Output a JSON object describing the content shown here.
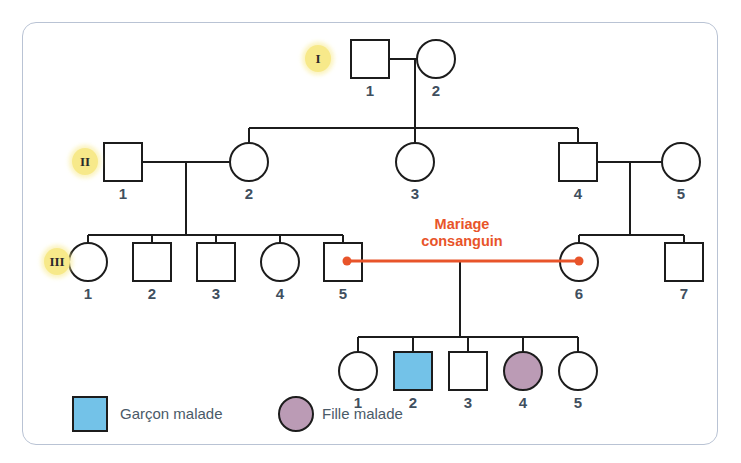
{
  "figure": {
    "accent_orange": "#e8542a",
    "affected_boy_color": "#73c2e8",
    "affected_girl_color": "#bb9bb5",
    "frame_color": "#b9c3d4",
    "number_color": "#3f4f5e",
    "badge_color": "#f7e98a"
  },
  "generations": [
    {
      "label": "I",
      "badge": "I"
    },
    {
      "label": "II",
      "badge": "II"
    },
    {
      "label": "III",
      "badge": "III"
    },
    {
      "label": "IV",
      "badge": ""
    }
  ],
  "individuals": [
    {
      "gen": "I",
      "id": "I-1",
      "number": "1",
      "sex": "male",
      "affected": false
    },
    {
      "gen": "I",
      "id": "I-2",
      "number": "2",
      "sex": "female",
      "affected": false
    },
    {
      "gen": "II",
      "id": "II-1",
      "number": "1",
      "sex": "male",
      "affected": false
    },
    {
      "gen": "II",
      "id": "II-2",
      "number": "2",
      "sex": "female",
      "affected": false
    },
    {
      "gen": "II",
      "id": "II-3",
      "number": "3",
      "sex": "female",
      "affected": false
    },
    {
      "gen": "II",
      "id": "II-4",
      "number": "4",
      "sex": "male",
      "affected": false
    },
    {
      "gen": "II",
      "id": "II-5",
      "number": "5",
      "sex": "female",
      "affected": false
    },
    {
      "gen": "III",
      "id": "III-1",
      "number": "1",
      "sex": "female",
      "affected": false
    },
    {
      "gen": "III",
      "id": "III-2",
      "number": "2",
      "sex": "male",
      "affected": false
    },
    {
      "gen": "III",
      "id": "III-3",
      "number": "3",
      "sex": "male",
      "affected": false
    },
    {
      "gen": "III",
      "id": "III-4",
      "number": "4",
      "sex": "female",
      "affected": false
    },
    {
      "gen": "III",
      "id": "III-5",
      "number": "5",
      "sex": "male",
      "affected": false
    },
    {
      "gen": "III",
      "id": "III-6",
      "number": "6",
      "sex": "female",
      "affected": false
    },
    {
      "gen": "III",
      "id": "III-7",
      "number": "7",
      "sex": "male",
      "affected": false
    },
    {
      "gen": "IV",
      "id": "IV-1",
      "number": "1",
      "sex": "female",
      "affected": false
    },
    {
      "gen": "IV",
      "id": "IV-2",
      "number": "2",
      "sex": "male",
      "affected": true
    },
    {
      "gen": "IV",
      "id": "IV-3",
      "number": "3",
      "sex": "male",
      "affected": false
    },
    {
      "gen": "IV",
      "id": "IV-4",
      "number": "4",
      "sex": "female",
      "affected": true
    },
    {
      "gen": "IV",
      "id": "IV-5",
      "number": "5",
      "sex": "female",
      "affected": false
    }
  ],
  "annotation": {
    "consanguineous_line1": "Mariage",
    "consanguineous_line2": "consanguin"
  },
  "legend": [
    {
      "key": "affected-boy",
      "shape": "square",
      "color": "#73c2e8",
      "label": "Garçon malade"
    },
    {
      "key": "affected-girl",
      "shape": "circle",
      "color": "#bb9bb5",
      "label": "Fille malade"
    }
  ],
  "numbers": {
    "I_1": "1",
    "I_2": "2",
    "II_1": "1",
    "II_2": "2",
    "II_3": "3",
    "II_4": "4",
    "II_5": "5",
    "III_1": "1",
    "III_2": "2",
    "III_3": "3",
    "III_4": "4",
    "III_5": "5",
    "III_6": "6",
    "III_7": "7",
    "IV_1": "1",
    "IV_2": "2",
    "IV_3": "3",
    "IV_4": "4",
    "IV_5": "5"
  },
  "badges": {
    "gen1": "I",
    "gen2": "II",
    "gen3": "III"
  }
}
